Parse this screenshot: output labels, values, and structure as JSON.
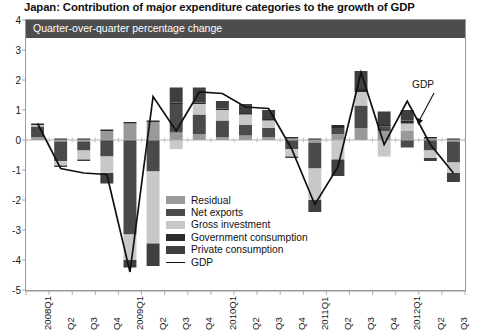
{
  "title": "Japan: Contribution of major expenditure categories to the growth of GDP",
  "subtitle": "Quarter-over-quarter percentage change",
  "annotation": {
    "gdp_label": "GDP"
  },
  "legend": {
    "position": "inside-center",
    "items": [
      {
        "label": "Residual",
        "color": "#999999",
        "type": "swatch"
      },
      {
        "label": "Net exports",
        "color": "#4a4a4a",
        "type": "swatch"
      },
      {
        "label": "Gross investment",
        "color": "#c8c8c8",
        "type": "swatch"
      },
      {
        "label": "Government consumption",
        "color": "#2b2b2b",
        "type": "swatch"
      },
      {
        "label": "Private consumption",
        "color": "#3f3f3f",
        "type": "swatch"
      },
      {
        "label": "GDP",
        "color": "#111111",
        "type": "line"
      }
    ]
  },
  "chart_data": {
    "type": "bar",
    "title": "Japan: Contribution of major expenditure categories to the growth of GDP",
    "subtitle": "Quarter-over-quarter percentage change",
    "xlabel": "",
    "ylabel": "",
    "ylim": [
      -5,
      4
    ],
    "yticks": [
      4,
      3,
      2,
      1,
      0,
      -1,
      -2,
      -3,
      -4,
      -5
    ],
    "ytick_labels": [
      "4",
      "3",
      "2",
      "1",
      "0",
      "-1",
      "-2",
      "-3",
      "-4",
      "-5"
    ],
    "grid": false,
    "stacked": true,
    "categories": [
      "2008Q1",
      "Q2",
      "Q3",
      "Q4",
      "2009Q1",
      "Q2",
      "Q3",
      "Q4",
      "2010Q1",
      "Q2",
      "Q3",
      "Q4",
      "2011Q1",
      "Q2",
      "Q3",
      "Q4",
      "2012Q1",
      "Q2",
      "Q3"
    ],
    "series": [
      {
        "name": "Residual",
        "color": "#999999",
        "values": [
          0.1,
          -0.05,
          -0.05,
          0.3,
          0.55,
          0.6,
          0.25,
          0.2,
          0.1,
          0.15,
          0.1,
          0.05,
          -0.1,
          0.2,
          0.4,
          0.3,
          0.3,
          0.05,
          -0.05
        ]
      },
      {
        "name": "Net exports",
        "color": "#4a4a4a",
        "values": [
          0.35,
          -0.65,
          -0.3,
          -0.55,
          -3.15,
          -1.05,
          0.95,
          0.65,
          0.55,
          0.35,
          0.3,
          -0.3,
          -0.85,
          0.2,
          0.75,
          0.15,
          -0.25,
          -0.35,
          -0.7
        ]
      },
      {
        "name": "Gross investment",
        "color": "#c8c8c8",
        "values": [
          0.05,
          -0.15,
          -0.3,
          -0.55,
          -0.85,
          -2.4,
          -0.3,
          0.35,
          0.35,
          0.35,
          0.25,
          -0.25,
          -1.05,
          -0.65,
          0.45,
          -0.55,
          0.25,
          -0.25,
          -0.35
        ]
      },
      {
        "name": "Government consumption",
        "color": "#2b2b2b",
        "values": [
          0.05,
          0.05,
          0.05,
          0.05,
          0.05,
          0.05,
          0.05,
          0.05,
          0.05,
          0.05,
          0.05,
          0.05,
          0.05,
          0.1,
          0.1,
          0.05,
          0.1,
          0.05,
          0.05
        ]
      },
      {
        "name": "Private consumption",
        "color": "#3f3f3f",
        "values": [
          0.0,
          -0.05,
          -0.05,
          -0.35,
          -0.25,
          -0.75,
          0.5,
          0.5,
          0.25,
          0.3,
          0.3,
          -0.05,
          -0.4,
          -0.55,
          0.6,
          0.45,
          0.35,
          -0.1,
          -0.3
        ]
      }
    ],
    "line_series": {
      "name": "GDP",
      "color": "#111111",
      "values": [
        0.55,
        -0.95,
        -1.1,
        -1.15,
        -4.4,
        1.45,
        0.3,
        1.6,
        1.55,
        1.1,
        1.05,
        -0.3,
        -2.15,
        -0.9,
        2.25,
        -0.15,
        1.3,
        -0.15,
        -1.1
      ]
    }
  }
}
